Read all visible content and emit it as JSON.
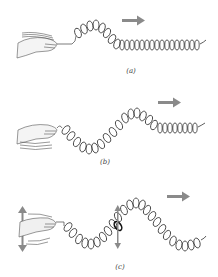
{
  "figure": {
    "arrow_color": "#8a8a8a",
    "spring_color": "#333333",
    "panels": [
      {
        "id": "a",
        "caption": "(a)",
        "description": "Single pulse traveling along spring"
      },
      {
        "id": "b",
        "caption": "(b)",
        "description": "Longer wave with half cycle"
      },
      {
        "id": "c",
        "caption": "(c)",
        "description": "Continuous wave with hand oscillating up and down; marked coil oscillates vertically"
      }
    ]
  }
}
